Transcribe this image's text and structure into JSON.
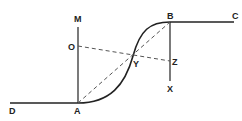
{
  "diagram": {
    "colors": {
      "line": "#222222",
      "dashed": "#555555",
      "background": "#ffffff"
    },
    "labels": {
      "M": "M",
      "O": "O",
      "A": "A",
      "D": "D",
      "B": "B",
      "C": "C",
      "Y": "Y",
      "Z": "Z",
      "X": "X"
    }
  }
}
